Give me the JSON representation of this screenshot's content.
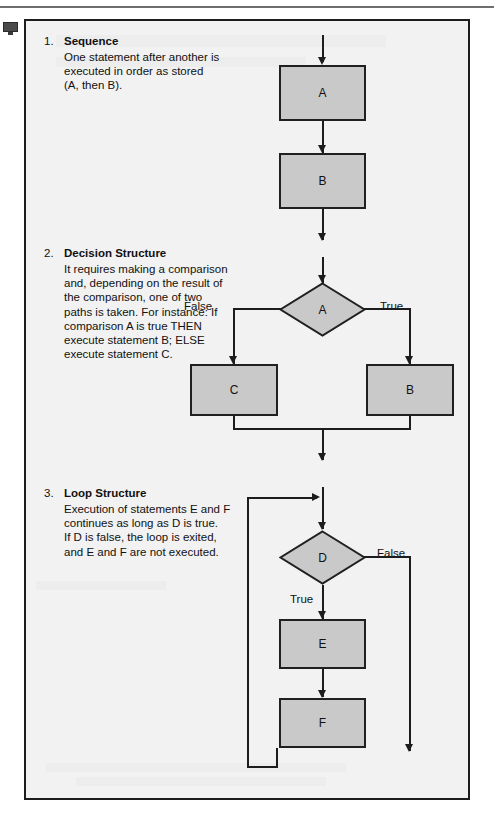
{
  "page": {
    "clipped_header_text": "",
    "margin_icon": "monitor-icon"
  },
  "colors": {
    "panel_background": "#f2f2f2",
    "shape_fill": "#c9c9c9",
    "stroke": "#1d1d1d",
    "text": "#111111"
  },
  "sections": [
    {
      "number": "1.",
      "title": "Sequence",
      "body": "One statement after another is\nexecuted in order as stored\n(A, then B)."
    },
    {
      "number": "2.",
      "title": "Decision Structure",
      "body": "It requires making a comparison\nand, depending on the result of\nthe comparison, one of two\npaths is taken.  For  instance: If\ncomparison A is true THEN\nexecute statement B; ELSE\nexecute statement C."
    },
    {
      "number": "3.",
      "title": "Loop Structure",
      "body": "Execution of statements E and F\ncontinues as long as D is true.\nIf D is false, the loop is exited,\nand E and F are not executed."
    }
  ],
  "flowcharts": {
    "sequence": {
      "nodes": [
        {
          "id": "A",
          "label": "A",
          "shape": "process"
        },
        {
          "id": "B",
          "label": "B",
          "shape": "process"
        }
      ],
      "edge_labels": []
    },
    "decision": {
      "nodes": [
        {
          "id": "A",
          "label": "A",
          "shape": "decision"
        },
        {
          "id": "C",
          "label": "C",
          "shape": "process"
        },
        {
          "id": "B",
          "label": "B",
          "shape": "process"
        }
      ],
      "edge_labels": [
        {
          "id": "false",
          "label": "False"
        },
        {
          "id": "true",
          "label": "True"
        }
      ]
    },
    "loop": {
      "nodes": [
        {
          "id": "D",
          "label": "D",
          "shape": "decision"
        },
        {
          "id": "E",
          "label": "E",
          "shape": "process"
        },
        {
          "id": "F",
          "label": "F",
          "shape": "process"
        }
      ],
      "edge_labels": [
        {
          "id": "false",
          "label": "False"
        },
        {
          "id": "true",
          "label": "True"
        }
      ]
    }
  }
}
